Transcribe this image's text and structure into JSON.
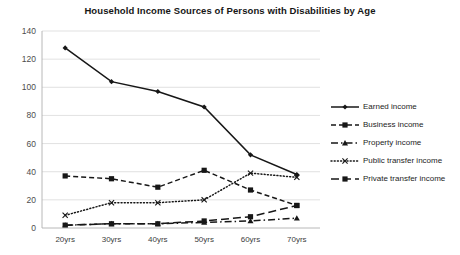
{
  "chart_data": {
    "type": "line",
    "title": "Household Income Sources of Persons with Disabilities by Age",
    "xlabel": "",
    "ylabel": "",
    "categories": [
      "20yrs",
      "30yrs",
      "40yrs",
      "50yrs",
      "60yrs",
      "70yrs"
    ],
    "ylim": [
      0,
      140
    ],
    "yticks": [
      0,
      20,
      40,
      60,
      80,
      100,
      120,
      140
    ],
    "grid": true,
    "legend_position": "right",
    "series": [
      {
        "name": "Earned income",
        "values": [
          128,
          104,
          97,
          86,
          52,
          38
        ],
        "marker": "diamond",
        "line_style": "solid"
      },
      {
        "name": "Business income",
        "values": [
          37,
          35,
          29,
          41,
          27,
          16
        ],
        "marker": "square",
        "line_style": "dashed"
      },
      {
        "name": "Property income",
        "values": [
          2,
          3,
          3,
          4,
          5,
          7
        ],
        "marker": "triangle",
        "line_style": "dash-dot"
      },
      {
        "name": "Public transfer income",
        "values": [
          9,
          18,
          18,
          20,
          39,
          36
        ],
        "marker": "x",
        "line_style": "dotted"
      },
      {
        "name": "Private transfer income",
        "values": [
          2,
          3,
          3,
          5,
          8,
          16
        ],
        "marker": "square",
        "line_style": "long-dash"
      }
    ]
  },
  "legend": {
    "items": [
      {
        "label": "Earned income"
      },
      {
        "label": "Business income"
      },
      {
        "label": "Property income"
      },
      {
        "label": "Public transfer income"
      },
      {
        "label": "Private transfer income"
      }
    ]
  }
}
